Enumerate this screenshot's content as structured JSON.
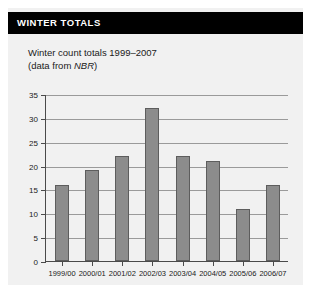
{
  "panel": {
    "header_title": "WINTER TOTALS",
    "subtitle_line1": "Winter count totals 1999–2007",
    "subtitle_line2_prefix": "(data from ",
    "subtitle_line2_source": "NBR",
    "subtitle_line2_suffix": ")",
    "background_color": "#f1f1f1",
    "header_background_color": "#000000",
    "header_text_color": "#ffffff"
  },
  "chart_data": {
    "type": "bar",
    "title": "Winter count totals 1999–2007",
    "subtitle": "(data from NBR)",
    "categories": [
      "1999/00",
      "2000/01",
      "2001/02",
      "2002/03",
      "2003/04",
      "2004/05",
      "2005/06",
      "2006/07"
    ],
    "values": [
      16,
      19,
      22,
      32,
      22,
      21,
      11,
      16
    ],
    "xlabel": "",
    "ylabel": "",
    "ylim": [
      0,
      35
    ],
    "ytick_values": [
      0,
      5,
      10,
      15,
      20,
      25,
      30,
      35
    ],
    "ytick_labels": [
      "0",
      "5",
      "10",
      "15",
      "20",
      "25",
      "30",
      "35"
    ],
    "ytick_interval": 5,
    "grid": true,
    "grid_orientation": "horizontal",
    "legend": false,
    "bar_color": "#8c8c8c",
    "bar_edge_color": "#5d5d5d",
    "axis_color": "#4a4a4a",
    "gridline_color": "#9a9a9a"
  }
}
